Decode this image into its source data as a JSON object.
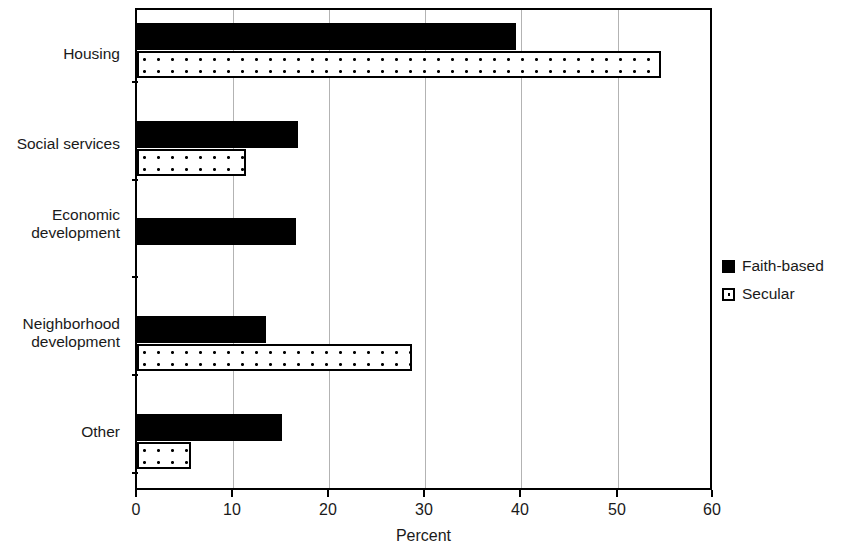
{
  "chart_data": {
    "type": "bar",
    "orientation": "horizontal",
    "title": "",
    "xlabel": "Percent",
    "ylabel": "",
    "xlim": [
      0,
      60
    ],
    "xticks": [
      0,
      10,
      20,
      30,
      40,
      50,
      60
    ],
    "grid": true,
    "grid_axis": "x",
    "legend_position": "right",
    "categories": [
      "Housing",
      "Social services",
      "Economic\ndevelopment",
      "Neighborhood\ndevelopment",
      "Other"
    ],
    "series": [
      {
        "name": "Faith-based",
        "color": "#000000",
        "pattern": "solid-fill",
        "values": [
          39.4,
          16.7,
          16.5,
          13.4,
          15.1
        ]
      },
      {
        "name": "Secular",
        "color": "#ffffff",
        "pattern": "dotted-fill-black-outline",
        "values": [
          54.5,
          11.3,
          0,
          28.6,
          5.6
        ]
      }
    ]
  },
  "legend": {
    "items": [
      {
        "label": "Faith-based",
        "marker": "filled-black-square"
      },
      {
        "label": "Secular",
        "marker": "dotted-white-square"
      }
    ]
  },
  "axis": {
    "x_title": "Percent",
    "tick_labels": [
      "0",
      "10",
      "20",
      "30",
      "40",
      "50",
      "60"
    ]
  }
}
